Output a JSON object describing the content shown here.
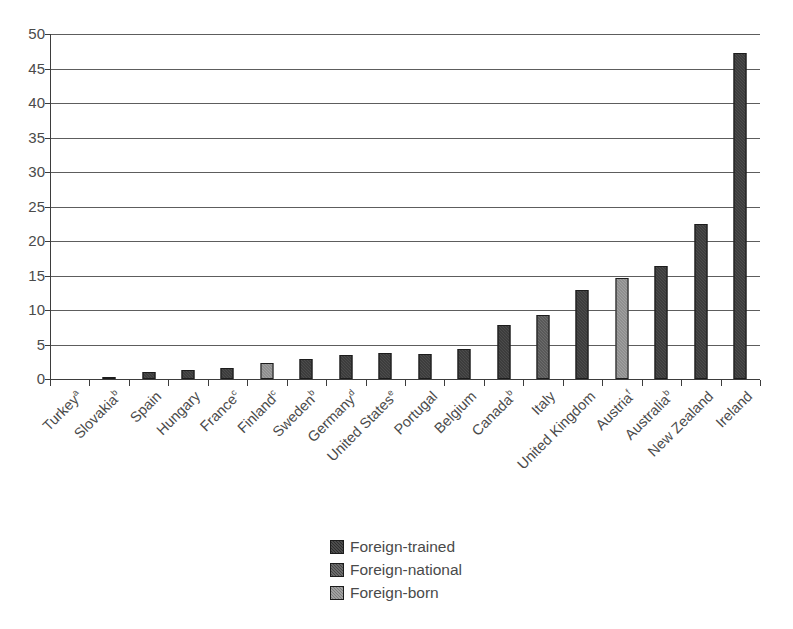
{
  "chart_data": {
    "type": "bar",
    "title": "",
    "xlabel": "",
    "ylabel": "",
    "ylim": [
      0,
      50
    ],
    "ytick_step": 5,
    "yticks": [
      50,
      45,
      40,
      35,
      30,
      25,
      20,
      15,
      10,
      5,
      0
    ],
    "grid": true,
    "legend_position": "bottom-center",
    "categories": [
      "Turkey",
      "Slovakia",
      "Spain",
      "Hungary",
      "France",
      "Finland",
      "Sweden",
      "Germany",
      "United States",
      "Portugal",
      "Belgium",
      "Canada",
      "Italy",
      "United Kingdom",
      "Austria",
      "Australia",
      "New Zealand",
      "Ireland"
    ],
    "category_footnotes": [
      "a",
      "b",
      "",
      "",
      "c",
      "c",
      "b",
      "d",
      "e",
      "",
      "",
      "b",
      "",
      "",
      "f",
      "b",
      "",
      ""
    ],
    "series": [
      {
        "name": "Foreign-trained",
        "color": "#2e2e2e",
        "values": [
          0.0,
          0.1,
          1.0,
          1.3,
          1.6,
          null,
          2.9,
          3.5,
          3.8,
          3.6,
          4.4,
          7.9,
          null,
          12.9,
          null,
          16.4,
          22.4,
          47.3
        ]
      },
      {
        "name": "Foreign-national",
        "color": "#474747",
        "values": [
          null,
          null,
          null,
          null,
          null,
          null,
          null,
          null,
          null,
          null,
          null,
          null,
          9.3,
          null,
          null,
          null,
          null,
          null
        ]
      },
      {
        "name": "Foreign-born",
        "color": "#7d7d7d",
        "values": [
          null,
          null,
          null,
          null,
          null,
          2.3,
          null,
          null,
          null,
          null,
          null,
          null,
          null,
          null,
          14.7,
          null,
          null,
          null
        ]
      }
    ],
    "bar_assignments": [
      {
        "category": "Turkey",
        "footnote": "a",
        "series": "Foreign-trained",
        "value": 0.0
      },
      {
        "category": "Slovakia",
        "footnote": "b",
        "series": "Foreign-trained",
        "value": 0.1
      },
      {
        "category": "Spain",
        "footnote": "",
        "series": "Foreign-trained",
        "value": 1.0
      },
      {
        "category": "Hungary",
        "footnote": "",
        "series": "Foreign-trained",
        "value": 1.3
      },
      {
        "category": "France",
        "footnote": "c",
        "series": "Foreign-trained",
        "value": 1.6
      },
      {
        "category": "Finland",
        "footnote": "c",
        "series": "Foreign-born",
        "value": 2.3
      },
      {
        "category": "Sweden",
        "footnote": "b",
        "series": "Foreign-trained",
        "value": 2.9
      },
      {
        "category": "Germany",
        "footnote": "d",
        "series": "Foreign-trained",
        "value": 3.5
      },
      {
        "category": "United States",
        "footnote": "e",
        "series": "Foreign-trained",
        "value": 3.8
      },
      {
        "category": "Portugal",
        "footnote": "",
        "series": "Foreign-trained",
        "value": 3.6
      },
      {
        "category": "Belgium",
        "footnote": "",
        "series": "Foreign-trained",
        "value": 4.4
      },
      {
        "category": "Canada",
        "footnote": "b",
        "series": "Foreign-trained",
        "value": 7.9
      },
      {
        "category": "Italy",
        "footnote": "",
        "series": "Foreign-national",
        "value": 9.3
      },
      {
        "category": "United Kingdom",
        "footnote": "",
        "series": "Foreign-trained",
        "value": 12.9
      },
      {
        "category": "Austria",
        "footnote": "f",
        "series": "Foreign-born",
        "value": 14.7
      },
      {
        "category": "Australia",
        "footnote": "b",
        "series": "Foreign-trained",
        "value": 16.4
      },
      {
        "category": "New Zealand",
        "footnote": "",
        "series": "Foreign-trained",
        "value": 22.4
      },
      {
        "category": "Ireland",
        "footnote": "",
        "series": "Foreign-trained",
        "value": 47.3
      }
    ]
  },
  "legend": {
    "items": [
      {
        "label": "Foreign-trained",
        "series_key": "trained"
      },
      {
        "label": "Foreign-national",
        "series_key": "national"
      },
      {
        "label": "Foreign-born",
        "series_key": "born"
      }
    ]
  }
}
